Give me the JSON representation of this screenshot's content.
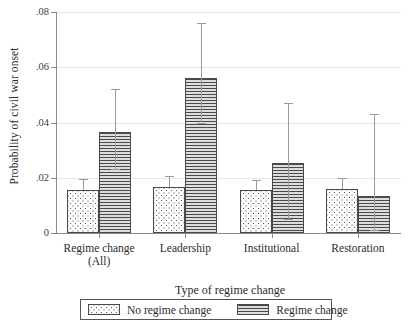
{
  "chart_data": {
    "type": "bar",
    "title": "",
    "xlabel": "Type of regime change",
    "ylabel": "Probability of civil war onset",
    "categories": [
      "Regime change (All)",
      "Leadership",
      "Institutional",
      "Restoration"
    ],
    "category_lines": [
      [
        "Regime change",
        "(All)"
      ],
      [
        "Leadership",
        ""
      ],
      [
        "Institutional",
        ""
      ],
      [
        "Restoration",
        ""
      ]
    ],
    "ylim": [
      0,
      0.08
    ],
    "yticks": [
      0,
      0.02,
      0.04,
      0.06,
      0.08
    ],
    "ytick_labels": [
      "0",
      ".02",
      ".04",
      ".06",
      ".08"
    ],
    "grid": true,
    "legend_position": "bottom",
    "series": [
      {
        "name": "No regime change",
        "fill": "dots",
        "values": [
          0.0155,
          0.0165,
          0.0155,
          0.016
        ],
        "ci_low": [
          0.0155,
          0.0165,
          0.0155,
          0.016
        ],
        "ci_high": [
          0.0195,
          0.0205,
          0.0192,
          0.0198
        ]
      },
      {
        "name": "Regime change",
        "fill": "lines",
        "values": [
          0.0365,
          0.056,
          0.0255,
          0.0135
        ],
        "ci_low": [
          0.023,
          0.04,
          0.0052,
          0.0012
        ],
        "ci_high": [
          0.052,
          0.076,
          0.047,
          0.043
        ]
      }
    ]
  },
  "legend": {
    "items": [
      {
        "label": "No regime change",
        "swatch": "dots-swatch"
      },
      {
        "label": "Regime change",
        "swatch": "lines-swatch"
      }
    ]
  }
}
